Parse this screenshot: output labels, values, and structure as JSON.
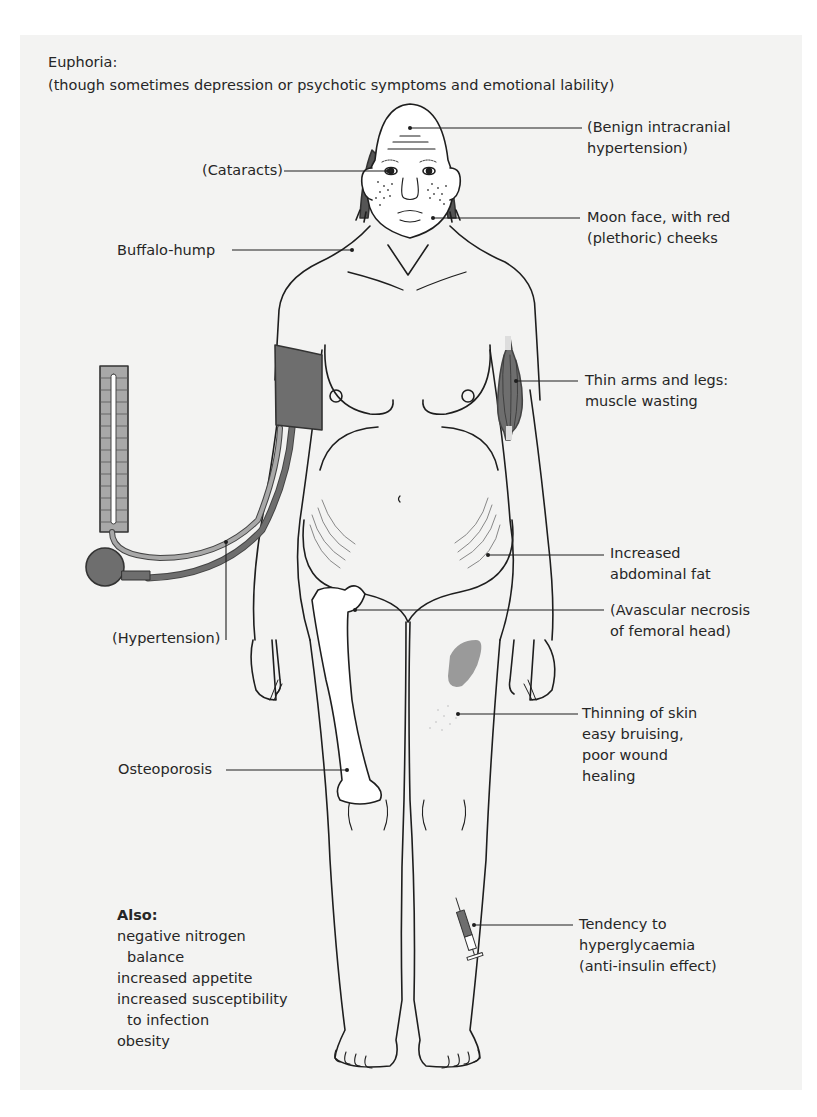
{
  "header": {
    "title": "Euphoria:",
    "subtitle": "(though sometimes depression or psychotic symptoms and emotional lability)"
  },
  "labels": {
    "intracranial": [
      "(Benign intracranial",
      "hypertension)"
    ],
    "cataracts": "(Cataracts)",
    "moon_face": [
      "Moon face, with red",
      "(plethoric) cheeks"
    ],
    "buffalo_hump": "Buffalo-hump",
    "thin_arms": [
      "Thin arms and legs:",
      "muscle wasting"
    ],
    "abdominal_fat": [
      "Increased",
      "abdominal fat"
    ],
    "avascular": [
      "(Avascular necrosis",
      "of femoral head)"
    ],
    "hypertension": "(Hypertension)",
    "skin": [
      "Thinning of skin",
      "easy bruising,",
      "poor wound",
      "healing"
    ],
    "osteoporosis": "Osteoporosis",
    "hyperglycaemia": [
      "Tendency to",
      "hyperglycaemia",
      "(anti-insulin effect)"
    ]
  },
  "also": {
    "heading": "Also:",
    "items": [
      {
        "text": "negative nitrogen",
        "indent": false
      },
      {
        "text": "balance",
        "indent": true
      },
      {
        "text": "increased appetite",
        "indent": false
      },
      {
        "text": "increased susceptibility",
        "indent": false
      },
      {
        "text": "to infection",
        "indent": true
      },
      {
        "text": "obesity",
        "indent": false
      }
    ]
  },
  "icons": {
    "sphygmomanometer": "blood-pressure-gauge",
    "cuff": "blood-pressure-cuff",
    "syringe": "insulin-syringe",
    "bruise": "bruise-patch",
    "muscle": "wasted-muscle"
  },
  "colors": {
    "panel": "#f3f3f2",
    "line": "#1e1e1e",
    "cuff": "#6e6e6e",
    "tube_light": "#a8a8a8",
    "bruise": "#9a9a9a",
    "hair": "#555555"
  }
}
